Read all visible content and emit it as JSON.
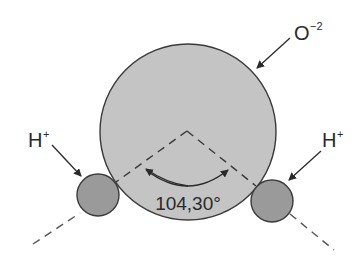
{
  "diagram": {
    "atoms": {
      "oxygen": {
        "label": "O",
        "charge": "−2",
        "fill": "#c4c4c4"
      },
      "hydrogen_left": {
        "label": "H",
        "charge": "+",
        "fill": "#9a9a9a"
      },
      "hydrogen_right": {
        "label": "H",
        "charge": "+",
        "fill": "#9a9a9a"
      }
    },
    "bond_angle": {
      "label": "104,30°",
      "value_deg": 104.5
    },
    "colors": {
      "stroke": "#3a3a3a",
      "oxygen_fill": "#c4c4c4",
      "hydrogen_fill": "#9a9a9a"
    }
  }
}
